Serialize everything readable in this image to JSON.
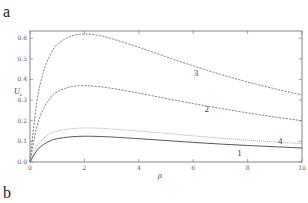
{
  "panels": {
    "top_label": "a",
    "bottom_label": "b"
  },
  "chart_data": {
    "type": "line",
    "title": "",
    "xlabel": "ρ",
    "ylabel": "U_e",
    "ylabel_main": "U",
    "ylabel_sub": "e",
    "xlim": [
      0,
      10
    ],
    "ylim": [
      0,
      0.635
    ],
    "xticks": [
      0,
      2,
      4,
      6,
      8,
      10
    ],
    "yticks": [
      0.0,
      0.1,
      0.2,
      0.3,
      0.4,
      0.5,
      0.6
    ],
    "ytick_labels": [
      "0.0",
      "0.1",
      "0.2",
      "0.3",
      "0.4",
      "0.5",
      "0.6"
    ],
    "grid": false,
    "legend": "inline curve labels",
    "x": [
      0,
      0.25,
      0.5,
      0.75,
      1,
      1.5,
      2,
      2.5,
      3,
      4,
      5,
      6,
      7,
      8,
      9,
      10
    ],
    "series": [
      {
        "name": "1",
        "style": "solid",
        "color": "#555555",
        "values": [
          0,
          0.055,
          0.085,
          0.103,
          0.113,
          0.122,
          0.125,
          0.124,
          0.121,
          0.113,
          0.104,
          0.095,
          0.087,
          0.08,
          0.074,
          0.068
        ]
      },
      {
        "name": "2",
        "style": "dashed",
        "color": "#777777",
        "values": [
          0,
          0.17,
          0.26,
          0.31,
          0.34,
          0.365,
          0.37,
          0.366,
          0.357,
          0.334,
          0.308,
          0.283,
          0.26,
          0.238,
          0.218,
          0.2
        ]
      },
      {
        "name": "3",
        "style": "dashed",
        "color": "#777777",
        "values": [
          0,
          0.29,
          0.44,
          0.52,
          0.57,
          0.61,
          0.62,
          0.614,
          0.598,
          0.556,
          0.51,
          0.466,
          0.425,
          0.388,
          0.355,
          0.325
        ]
      },
      {
        "name": "4",
        "style": "dotted",
        "color": "#888888",
        "values": [
          0,
          0.075,
          0.115,
          0.138,
          0.15,
          0.161,
          0.165,
          0.164,
          0.16,
          0.15,
          0.139,
          0.127,
          0.116,
          0.106,
          0.097,
          0.089
        ]
      }
    ],
    "annotations": [
      {
        "text": "3",
        "x": 6.1,
        "y": 0.43
      },
      {
        "text": "2",
        "x": 6.5,
        "y": 0.255
      },
      {
        "text": "4",
        "x": 9.2,
        "y": 0.1
      },
      {
        "text": "1",
        "x": 7.7,
        "y": 0.045
      }
    ]
  }
}
